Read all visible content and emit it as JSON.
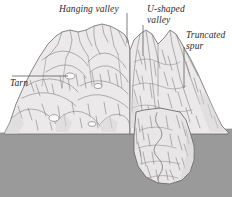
{
  "figure": {
    "labels": [
      {
        "id": "hanging-valley",
        "text": "Hanging valley"
      },
      {
        "id": "u-shaped-valley",
        "text": "U-shaped\nvalley"
      },
      {
        "id": "truncated-spur",
        "text": "Truncated\nspur"
      },
      {
        "id": "tarn",
        "text": "Tarn"
      }
    ],
    "colors": {
      "background": "#ffffff",
      "bedrock_block": "#9a9a9a",
      "terrain_fill": "#ebe9e9",
      "terrain_shadow": "#d2d0d0",
      "ink": "#5d5a5a",
      "label_text": "#2b2b2b",
      "tarn_fill": "#fbfbfb"
    }
  }
}
